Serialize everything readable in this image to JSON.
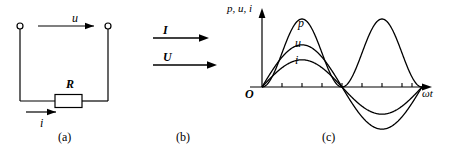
{
  "figure": {
    "background_color": "#ffffff",
    "stroke_color": "#000000"
  },
  "panel_a": {
    "caption": "(a)",
    "voltage_label": "u",
    "resistor_label": "R",
    "current_label": "i",
    "arrow_voltage_direction": "right",
    "arrow_current_direction": "right",
    "terminal_count": 2
  },
  "panel_b": {
    "caption": "(b)",
    "phasors": [
      {
        "label": "I",
        "length_px": 56,
        "direction": "right"
      },
      {
        "label": "U",
        "length_px": 66,
        "direction": "right"
      }
    ]
  },
  "panel_c": {
    "caption": "(c)",
    "y_axis_label": "p, u, i",
    "x_axis_label": "ωt",
    "origin_label": "O",
    "curve_labels": {
      "power": "p",
      "voltage": "u",
      "current": "i"
    }
  },
  "chart_data": {
    "type": "line",
    "title": "",
    "xlabel": "ωt",
    "ylabel": "p, u, i",
    "xlim": [
      0,
      12.566
    ],
    "ylim": [
      -1.05,
      1.05
    ],
    "grid": false,
    "legend": "inline-curve-labels",
    "x_tick_positions_rad": [
      1.571,
      3.142,
      4.712,
      6.283,
      7.854,
      9.425,
      10.996,
      12.566
    ],
    "x_tick_labels": [],
    "series": [
      {
        "name": "p",
        "label": "p",
        "formula": "p = U*I*(1 - cos(2*wt))/1",
        "amplitude": 1.0,
        "offset": 0.0,
        "period_rad": 6.283,
        "phase_rad": 0,
        "peaks": [
          {
            "x_rad": 3.142,
            "y": 1.0
          },
          {
            "x_rad": 9.425,
            "y": 1.0
          }
        ],
        "zeros_rad": [
          0,
          6.283,
          12.566
        ],
        "description": "instantaneous power, always non-negative, double frequency"
      },
      {
        "name": "u",
        "label": "u",
        "formula": "u = Um*sin(wt)",
        "amplitude": 0.62,
        "offset": 0.0,
        "period_rad": 12.566,
        "phase_rad": 0,
        "peaks": [
          {
            "x_rad": 3.142,
            "y": 0.62
          },
          {
            "x_rad": 9.425,
            "y": -0.62
          }
        ],
        "zeros_rad": [
          0,
          6.283,
          12.566
        ],
        "description": "voltage sine wave, in phase with current"
      },
      {
        "name": "i",
        "label": "i",
        "formula": "i = Im*sin(wt)",
        "amplitude": 0.4,
        "offset": 0.0,
        "period_rad": 12.566,
        "phase_rad": 0,
        "peaks": [
          {
            "x_rad": 3.142,
            "y": 0.4
          },
          {
            "x_rad": 9.425,
            "y": -0.4
          }
        ],
        "zeros_rad": [
          0,
          6.283,
          12.566
        ],
        "description": "current sine wave, in phase with voltage"
      }
    ]
  }
}
